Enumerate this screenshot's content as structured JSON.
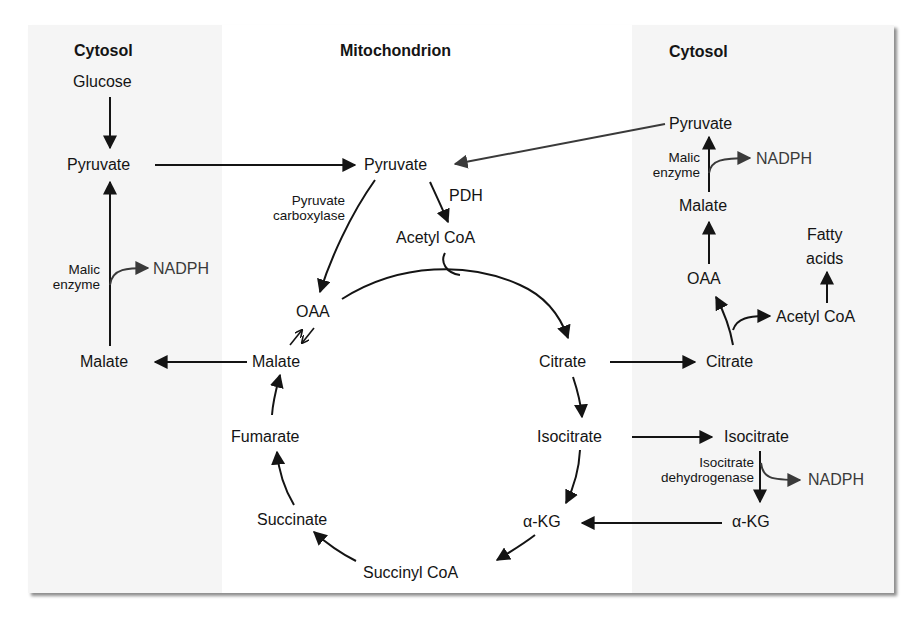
{
  "headers": {
    "cytosol_left": "Cytosol",
    "mitochondrion": "Mitochondrion",
    "cytosol_right": "Cytosol"
  },
  "left_cytosol": {
    "glucose": "Glucose",
    "pyruvate": "Pyruvate",
    "malic_enzyme_1": "Malic",
    "malic_enzyme_2": "enzyme",
    "nadph": "NADPH",
    "malate": "Malate"
  },
  "mitochondrion": {
    "pyruvate": "Pyruvate",
    "pyruvate_carboxylase_1": "Pyruvate",
    "pyruvate_carboxylase_2": "carboxylase",
    "pdh": "PDH",
    "acetyl_coa": "Acetyl CoA",
    "oaa": "OAA",
    "malate": "Malate",
    "fumarate": "Fumarate",
    "succinate": "Succinate",
    "succinyl_coa": "Succinyl CoA",
    "alpha_kg": "α-KG",
    "isocitrate": "Isocitrate",
    "citrate": "Citrate"
  },
  "right_cytosol": {
    "pyruvate": "Pyruvate",
    "malic_enzyme_1": "Malic",
    "malic_enzyme_2": "enzyme",
    "nadph_top": "NADPH",
    "malate": "Malate",
    "fatty_acids_1": "Fatty",
    "fatty_acids_2": "acids",
    "oaa": "OAA",
    "acetyl_coa": "Acetyl CoA",
    "citrate": "Citrate",
    "isocitrate": "Isocitrate",
    "icdh_1": "Isocitrate",
    "icdh_2": "dehydrogenase",
    "nadph_bottom": "NADPH",
    "alpha_kg": "α-KG"
  },
  "colors": {
    "ink": "#141414",
    "secondary_ink": "#3a3a3a",
    "cytosol_bg": "#f5f5f5",
    "mitochondrion_bg": "#ffffff"
  }
}
